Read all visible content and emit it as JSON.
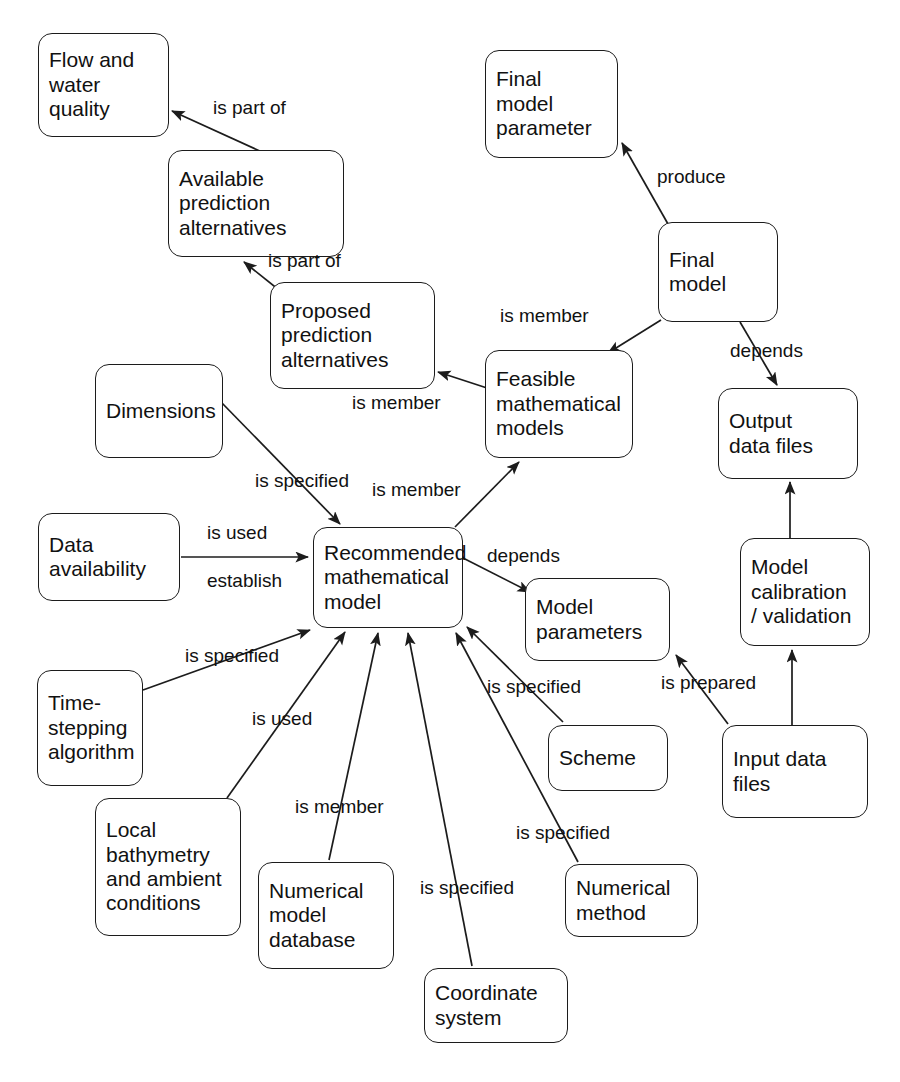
{
  "diagram": {
    "canvas": {
      "width": 900,
      "height": 1082
    },
    "style": {
      "line_color": "#1c1c1c",
      "box_fill": "#ffffff",
      "text_color": "#111111"
    },
    "nodes": [
      {
        "id": "flow_water_quality",
        "label": "Flow and\nwater\nquality",
        "x": 38,
        "y": 33,
        "w": 131,
        "h": 104
      },
      {
        "id": "available_prediction_alternatives",
        "label": "Available\nprediction\nalternatives",
        "x": 168,
        "y": 150,
        "w": 176,
        "h": 107
      },
      {
        "id": "proposed_prediction_alternatives",
        "label": "Proposed\nprediction\nalternatives",
        "x": 270,
        "y": 282,
        "w": 165,
        "h": 107
      },
      {
        "id": "dimensions",
        "label": "Dimensions",
        "x": 95,
        "y": 364,
        "w": 128,
        "h": 94
      },
      {
        "id": "data_availability",
        "label": "Data\navailability",
        "x": 38,
        "y": 513,
        "w": 142,
        "h": 88
      },
      {
        "id": "recommended_mathematical_model",
        "label": "Recommended\nmathematical\nmodel",
        "x": 313,
        "y": 527,
        "w": 150,
        "h": 101
      },
      {
        "id": "feasible_mathematical_models",
        "label": "Feasible\nmathematical\nmodels",
        "x": 485,
        "y": 350,
        "w": 148,
        "h": 108
      },
      {
        "id": "final_model_parameter",
        "label": "Final\nmodel\nparameter",
        "x": 485,
        "y": 50,
        "w": 133,
        "h": 108
      },
      {
        "id": "final_model",
        "label": "Final\nmodel",
        "x": 658,
        "y": 222,
        "w": 120,
        "h": 100
      },
      {
        "id": "output_data_files",
        "label": "Output\ndata files",
        "x": 718,
        "y": 388,
        "w": 140,
        "h": 91
      },
      {
        "id": "model_parameters",
        "label": "Model\nparameters",
        "x": 525,
        "y": 578,
        "w": 145,
        "h": 83
      },
      {
        "id": "model_calibration_validation",
        "label": "Model\ncalibration\n/ validation",
        "x": 740,
        "y": 538,
        "w": 130,
        "h": 108
      },
      {
        "id": "scheme",
        "label": "Scheme",
        "x": 548,
        "y": 725,
        "w": 120,
        "h": 66
      },
      {
        "id": "input_data_files",
        "label": "Input data\nfiles",
        "x": 722,
        "y": 725,
        "w": 146,
        "h": 93
      },
      {
        "id": "time_stepping_algorithm",
        "label": "Time-\nstepping\nalgorithm",
        "x": 37,
        "y": 670,
        "w": 106,
        "h": 116
      },
      {
        "id": "local_bathymetry",
        "label": "Local\nbathymetry\nand ambient\nconditions",
        "x": 95,
        "y": 798,
        "w": 146,
        "h": 138
      },
      {
        "id": "numerical_model_database",
        "label": "Numerical\nmodel\ndatabase",
        "x": 258,
        "y": 862,
        "w": 136,
        "h": 107
      },
      {
        "id": "numerical_method",
        "label": "Numerical\nmethod",
        "x": 565,
        "y": 864,
        "w": 133,
        "h": 73
      },
      {
        "id": "coordinate_system",
        "label": "Coordinate\nsystem",
        "x": 424,
        "y": 968,
        "w": 144,
        "h": 75
      }
    ],
    "edges": [
      {
        "id": "e1",
        "from": "available_prediction_alternatives",
        "to": "flow_water_quality",
        "label": "is part of",
        "label_x": 213,
        "label_y": 97,
        "arrow": "end",
        "path": "M 262 152 L 172 111"
      },
      {
        "id": "e2",
        "from": "proposed_prediction_alternatives",
        "to": "available_prediction_alternatives",
        "label": "is part of",
        "label_x": 268,
        "label_y": 250,
        "arrow": "end",
        "path": "M 279 290 L 244 262"
      },
      {
        "id": "e3",
        "from": "feasible_mathematical_models",
        "to": "proposed_prediction_alternatives",
        "label": "is member",
        "label_x": 352,
        "label_y": 392,
        "arrow": "end",
        "path": "M 487 388 L 438 372"
      },
      {
        "id": "e4",
        "from": "dimensions",
        "to": "recommended_mathematical_model",
        "label": "is specified",
        "label_x": 255,
        "label_y": 470,
        "arrow": "end",
        "path": "M 221 402 L 340 524"
      },
      {
        "id": "e5",
        "from": "recommended_mathematical_model",
        "to": "feasible_mathematical_models",
        "label": "is member",
        "label_x": 372,
        "label_y": 479,
        "arrow": "end",
        "path": "M 455 527 L 519 462"
      },
      {
        "id": "e6",
        "from": "data_availability",
        "to": "recommended_mathematical_model",
        "label": "is used",
        "label_x": 207,
        "label_y": 522,
        "arrow": "end",
        "path": "M 181 557 L 308 557"
      },
      {
        "id": "e7",
        "from": "data_availability",
        "to": "recommended_mathematical_model",
        "label": "establish",
        "label_x": 207,
        "label_y": 570,
        "arrow": "none",
        "path": ""
      },
      {
        "id": "e8",
        "from": "recommended_mathematical_model",
        "to": "model_parameters",
        "label": "depends",
        "label_x": 487,
        "label_y": 545,
        "arrow": "end",
        "path": "M 463 558 L 530 592"
      },
      {
        "id": "e9",
        "from": "final_model",
        "to": "final_model_parameter",
        "label": "produce",
        "label_x": 657,
        "label_y": 166,
        "arrow": "end",
        "path": "M 668 224 L 622 143"
      },
      {
        "id": "e10",
        "from": "final_model",
        "to": "feasible_mathematical_models",
        "label": "is member",
        "label_x": 500,
        "label_y": 305,
        "arrow": "end",
        "path": "M 661 320 L 608 353"
      },
      {
        "id": "e11",
        "from": "final_model",
        "to": "output_data_files",
        "label": "depends",
        "label_x": 730,
        "label_y": 340,
        "arrow": "end",
        "path": "M 740 322 L 777 385"
      },
      {
        "id": "e12",
        "from": "model_calibration_validation",
        "to": "output_data_files",
        "label": "",
        "label_x": 0,
        "label_y": 0,
        "arrow": "end",
        "path": "M 790 538 L 790 482"
      },
      {
        "id": "e13",
        "from": "input_data_files",
        "to": "model_calibration_validation",
        "label": "",
        "label_x": 0,
        "label_y": 0,
        "arrow": "end",
        "path": "M 792 725 L 792 650"
      },
      {
        "id": "e14",
        "from": "input_data_files",
        "to": "model_parameters",
        "label": "is prepared",
        "label_x": 661,
        "label_y": 672,
        "arrow": "end",
        "path": "M 728 724 L 676 655"
      },
      {
        "id": "e15",
        "from": "scheme",
        "to": "recommended_mathematical_model",
        "label": "is specified",
        "label_x": 487,
        "label_y": 676,
        "arrow": "end",
        "path": "M 563 722 L 467 627"
      },
      {
        "id": "e16",
        "from": "numerical_method",
        "to": "recommended_mathematical_model",
        "label": "is specified",
        "label_x": 516,
        "label_y": 822,
        "arrow": "end",
        "path": "M 578 862 L 456 633"
      },
      {
        "id": "e17",
        "from": "coordinate_system",
        "to": "recommended_mathematical_model",
        "label": "is specified",
        "label_x": 420,
        "label_y": 877,
        "arrow": "end",
        "path": "M 472 966 L 408 633"
      },
      {
        "id": "e18",
        "from": "numerical_model_database",
        "to": "recommended_mathematical_model",
        "label": "is member",
        "label_x": 295,
        "label_y": 796,
        "arrow": "end",
        "path": "M 329 860 L 378 633"
      },
      {
        "id": "e19",
        "from": "local_bathymetry",
        "to": "recommended_mathematical_model",
        "label": "is used",
        "label_x": 252,
        "label_y": 708,
        "arrow": "end",
        "path": "M 227 798 L 345 632"
      },
      {
        "id": "e20",
        "from": "time_stepping_algorithm",
        "to": "recommended_mathematical_model",
        "label": "is specified",
        "label_x": 185,
        "label_y": 645,
        "arrow": "end",
        "path": "M 143 690 L 310 630"
      }
    ]
  }
}
